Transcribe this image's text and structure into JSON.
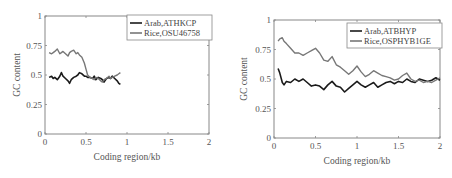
{
  "chart_data": [
    {
      "type": "line",
      "title": "",
      "xlabel": "Coding region/kb",
      "ylabel": "GC content",
      "xlim": [
        0,
        2
      ],
      "ylim": [
        0,
        1
      ],
      "xticks": [
        "0",
        "0.5",
        "1",
        "1.5",
        "2"
      ],
      "yticks": [
        "0",
        "0.25",
        "0.5",
        "0.75",
        "1"
      ],
      "grid": false,
      "legend_position": "upper right",
      "series": [
        {
          "name": "Arab,ATHKCP",
          "color": "#1a1a1a",
          "x": [
            0.05,
            0.08,
            0.1,
            0.12,
            0.15,
            0.18,
            0.2,
            0.22,
            0.25,
            0.28,
            0.3,
            0.32,
            0.35,
            0.38,
            0.4,
            0.42,
            0.45,
            0.48,
            0.5,
            0.52,
            0.55,
            0.58,
            0.6,
            0.62,
            0.65,
            0.68,
            0.7,
            0.72,
            0.75,
            0.78,
            0.8,
            0.82,
            0.85,
            0.88,
            0.9,
            0.92
          ],
          "y": [
            0.48,
            0.49,
            0.47,
            0.48,
            0.46,
            0.49,
            0.52,
            0.49,
            0.47,
            0.45,
            0.43,
            0.46,
            0.48,
            0.49,
            0.5,
            0.52,
            0.51,
            0.49,
            0.49,
            0.48,
            0.48,
            0.47,
            0.49,
            0.46,
            0.48,
            0.47,
            0.46,
            0.44,
            0.47,
            0.48,
            0.47,
            0.49,
            0.47,
            0.45,
            0.43,
            0.42
          ]
        },
        {
          "name": "Rice,OSU46758",
          "color": "#777777",
          "x": [
            0.05,
            0.08,
            0.1,
            0.12,
            0.15,
            0.18,
            0.2,
            0.22,
            0.25,
            0.28,
            0.3,
            0.32,
            0.35,
            0.38,
            0.4,
            0.42,
            0.45,
            0.48,
            0.5,
            0.52,
            0.55,
            0.58,
            0.6,
            0.62,
            0.65,
            0.68,
            0.7,
            0.72,
            0.75,
            0.78,
            0.8,
            0.82,
            0.85,
            0.88,
            0.9,
            0.92
          ],
          "y": [
            0.69,
            0.68,
            0.69,
            0.7,
            0.72,
            0.68,
            0.69,
            0.7,
            0.68,
            0.66,
            0.69,
            0.7,
            0.71,
            0.68,
            0.69,
            0.67,
            0.65,
            0.6,
            0.55,
            0.5,
            0.48,
            0.47,
            0.46,
            0.48,
            0.47,
            0.45,
            0.44,
            0.46,
            0.47,
            0.49,
            0.47,
            0.48,
            0.49,
            0.5,
            0.51,
            0.52
          ]
        }
      ]
    },
    {
      "type": "line",
      "title": "",
      "xlabel": "Coding region/kb",
      "ylabel": "GC content",
      "xlim": [
        0,
        2
      ],
      "ylim": [
        0,
        1
      ],
      "xticks": [
        "0",
        "0.5",
        "1",
        "1.5",
        "2"
      ],
      "yticks": [
        "0",
        "0.25",
        "0.5",
        "0.75",
        "1"
      ],
      "grid": false,
      "legend_position": "upper right",
      "series": [
        {
          "name": "Arab,ATBHYP",
          "color": "#1a1a1a",
          "x": [
            0.05,
            0.07,
            0.1,
            0.12,
            0.15,
            0.2,
            0.25,
            0.3,
            0.35,
            0.4,
            0.45,
            0.5,
            0.55,
            0.6,
            0.65,
            0.7,
            0.75,
            0.8,
            0.85,
            0.9,
            0.95,
            1.0,
            1.05,
            1.1,
            1.15,
            1.2,
            1.25,
            1.3,
            1.35,
            1.4,
            1.45,
            1.5,
            1.55,
            1.6,
            1.65,
            1.7,
            1.75,
            1.8,
            1.85,
            1.9,
            1.95,
            2.0
          ],
          "y": [
            0.59,
            0.55,
            0.47,
            0.45,
            0.48,
            0.47,
            0.5,
            0.48,
            0.5,
            0.47,
            0.44,
            0.45,
            0.44,
            0.41,
            0.45,
            0.48,
            0.44,
            0.43,
            0.39,
            0.42,
            0.45,
            0.48,
            0.45,
            0.43,
            0.45,
            0.47,
            0.43,
            0.45,
            0.47,
            0.48,
            0.46,
            0.48,
            0.47,
            0.5,
            0.48,
            0.47,
            0.5,
            0.49,
            0.48,
            0.49,
            0.51,
            0.49
          ]
        },
        {
          "name": "Rice,OSPHYB1GE",
          "color": "#777777",
          "x": [
            0.05,
            0.07,
            0.1,
            0.12,
            0.15,
            0.2,
            0.25,
            0.3,
            0.35,
            0.4,
            0.45,
            0.5,
            0.55,
            0.6,
            0.65,
            0.7,
            0.75,
            0.8,
            0.85,
            0.9,
            0.95,
            1.0,
            1.05,
            1.1,
            1.15,
            1.2,
            1.25,
            1.3,
            1.35,
            1.4,
            1.45,
            1.5,
            1.55,
            1.6,
            1.65,
            1.7,
            1.75,
            1.8,
            1.85,
            1.9,
            1.95,
            2.0
          ],
          "y": [
            0.82,
            0.84,
            0.85,
            0.82,
            0.8,
            0.76,
            0.72,
            0.72,
            0.7,
            0.72,
            0.74,
            0.76,
            0.72,
            0.66,
            0.65,
            0.69,
            0.62,
            0.6,
            0.57,
            0.54,
            0.57,
            0.61,
            0.56,
            0.52,
            0.54,
            0.57,
            0.55,
            0.53,
            0.52,
            0.51,
            0.49,
            0.5,
            0.53,
            0.55,
            0.5,
            0.48,
            0.49,
            0.47,
            0.48,
            0.47,
            0.49,
            0.51
          ]
        }
      ]
    }
  ]
}
